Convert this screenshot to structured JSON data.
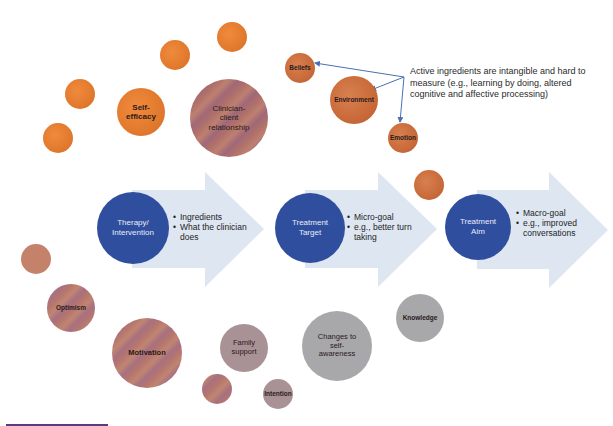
{
  "diagram": {
    "stages": [
      {
        "label": "Therapy/\nIntervention",
        "bullets": [
          "Ingredients",
          "What the clinician does"
        ]
      },
      {
        "label": "Treatment\nTarget",
        "bullets": [
          "Micro-goal",
          "e.g., better turn taking"
        ]
      },
      {
        "label": "Treatment\nAim",
        "bullets": [
          "Macro-goal",
          "e.g., improved conversations"
        ]
      }
    ],
    "annotation": "Active ingredients are intangible and hard to measure (e.g., learning by doing, altered cognitive and affective processing)",
    "bubbles": {
      "self_efficacy": "Self-\nefficacy",
      "clinician_client": "Clinician-\nclient\nrelationship",
      "beliefs": "Beliefs",
      "environment": "Environment",
      "emotion": "Emotion",
      "optimism": "Optimism",
      "motivation": "Motivation",
      "family_support": "Family\nsupport",
      "intention": "Intention",
      "changes_self_awareness": "Changes to\nself-\nawareness",
      "knowledge": "Knowledge"
    },
    "colors": {
      "stage_circle": "#2f4f9e",
      "arrow_fill": "#dde6f1",
      "connector": "#4a6fb5",
      "orange_bubble": "#e27a2e",
      "rust_bubble": "#c96a3a",
      "grey_bubble": "#a8a7aa"
    }
  }
}
